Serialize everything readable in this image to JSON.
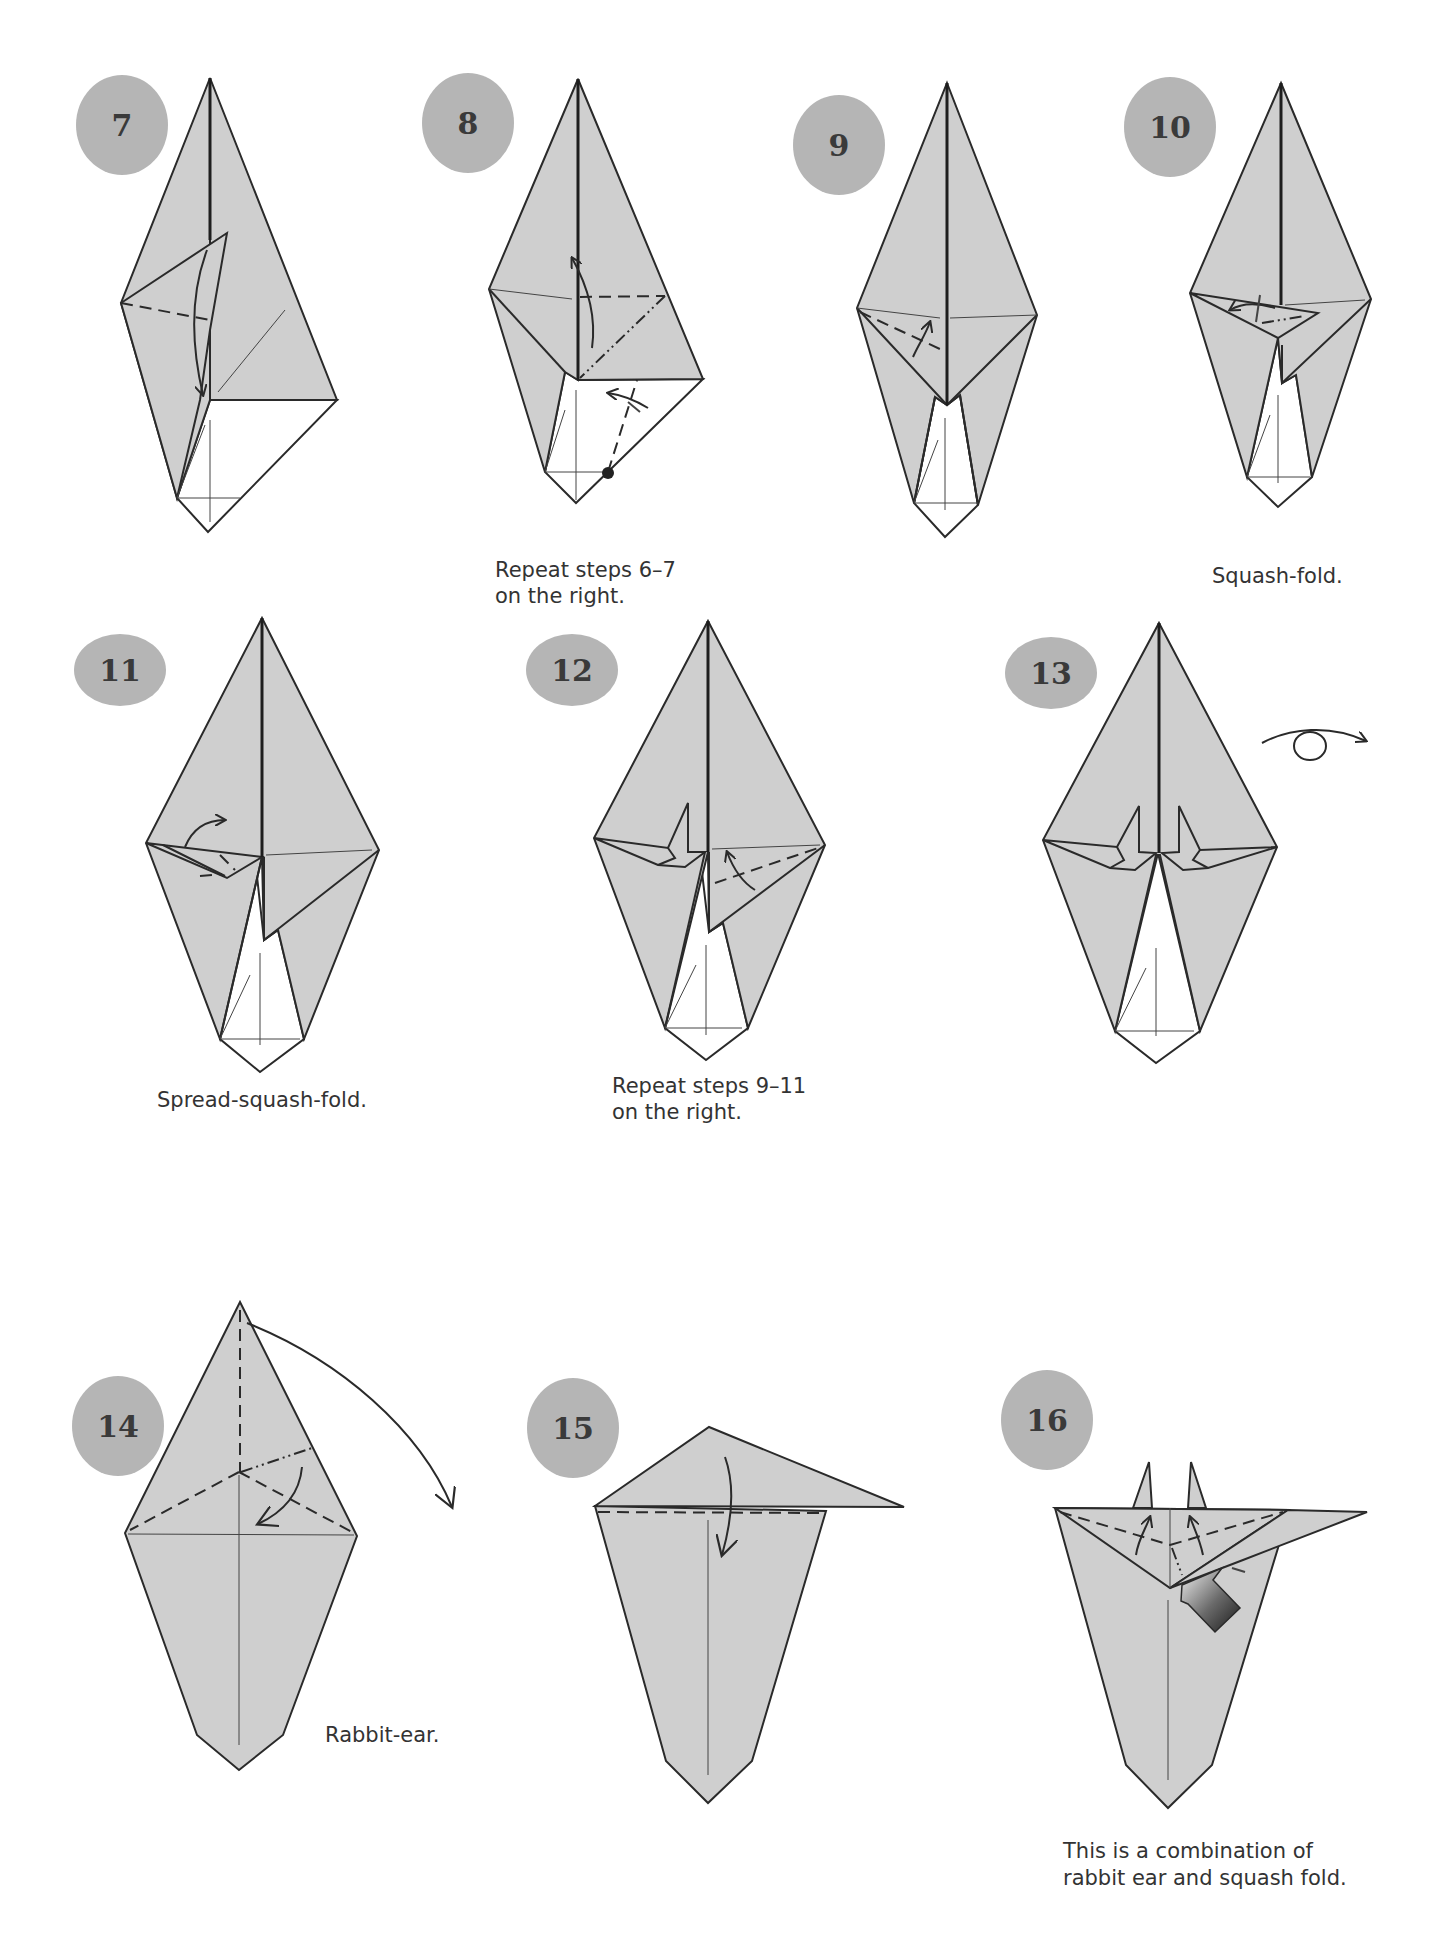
{
  "page": {
    "type": "origami-instructions",
    "colors": {
      "paper": "#cfcfcf",
      "badge": "#b5b5b5",
      "badge_text": "#3a3a3a",
      "line": "#2a2a2a",
      "background": "#ffffff"
    }
  },
  "steps": [
    {
      "number": "7",
      "caption": []
    },
    {
      "number": "8",
      "caption": [
        "Repeat steps 6–7",
        "on the right."
      ]
    },
    {
      "number": "9",
      "caption": []
    },
    {
      "number": "10",
      "caption": [
        "Squash-fold."
      ]
    },
    {
      "number": "11",
      "caption": [
        "Spread-squash-fold."
      ]
    },
    {
      "number": "12",
      "caption": [
        "Repeat steps 9–11",
        "on the right."
      ]
    },
    {
      "number": "13",
      "caption": [],
      "symbol": "turn-over-icon"
    },
    {
      "number": "14",
      "caption": [
        "Rabbit-ear."
      ]
    },
    {
      "number": "15",
      "caption": []
    },
    {
      "number": "16",
      "caption": [
        "This is a combination of",
        "rabbit ear and squash fold."
      ],
      "symbol": "push-arrow-icon"
    }
  ]
}
